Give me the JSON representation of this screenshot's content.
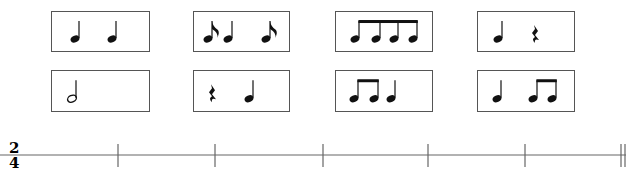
{
  "rhythm_cards": [
    {
      "id": "card-1",
      "row": 1,
      "col": 1,
      "x": 51,
      "y": 11,
      "w": 99,
      "h": 41,
      "content": "quarter quarter",
      "notes": [
        {
          "type": "quarter",
          "x": 23
        },
        {
          "type": "quarter",
          "x": 60
        }
      ]
    },
    {
      "id": "card-2",
      "row": 1,
      "col": 2,
      "x": 193,
      "y": 11,
      "w": 97,
      "h": 41,
      "content": "eighth quarter eighth",
      "notes": [
        {
          "type": "eighth",
          "x": 14
        },
        {
          "type": "quarter",
          "x": 34
        },
        {
          "type": "eighth",
          "x": 72
        }
      ]
    },
    {
      "id": "card-3",
      "row": 1,
      "col": 3,
      "x": 335,
      "y": 11,
      "w": 98,
      "h": 41,
      "content": "four beamed eighths",
      "notes": [
        {
          "type": "beam",
          "xs": [
            19,
            40,
            58,
            77
          ]
        }
      ]
    },
    {
      "id": "card-4",
      "row": 1,
      "col": 4,
      "x": 477,
      "y": 11,
      "w": 98,
      "h": 41,
      "content": "quarter quarter-rest",
      "notes": [
        {
          "type": "quarter",
          "x": 20
        },
        {
          "type": "quarter-rest",
          "x": 56
        }
      ]
    },
    {
      "id": "card-5",
      "row": 2,
      "col": 1,
      "x": 51,
      "y": 70,
      "w": 99,
      "h": 42,
      "content": "half note",
      "notes": [
        {
          "type": "half",
          "x": 20
        }
      ]
    },
    {
      "id": "card-6",
      "row": 2,
      "col": 2,
      "x": 193,
      "y": 70,
      "w": 97,
      "h": 42,
      "content": "quarter-rest quarter",
      "notes": [
        {
          "type": "quarter-rest",
          "x": 17
        },
        {
          "type": "quarter",
          "x": 55
        }
      ]
    },
    {
      "id": "card-7",
      "row": 2,
      "col": 3,
      "x": 335,
      "y": 70,
      "w": 98,
      "h": 42,
      "content": "two beamed eighths quarter",
      "notes": [
        {
          "type": "beam",
          "xs": [
            18,
            38
          ]
        },
        {
          "type": "quarter",
          "x": 55
        }
      ]
    },
    {
      "id": "card-8",
      "row": 2,
      "col": 4,
      "x": 477,
      "y": 70,
      "w": 98,
      "h": 42,
      "content": "quarter two beamed eighths",
      "notes": [
        {
          "type": "quarter",
          "x": 19
        },
        {
          "type": "beam",
          "xs": [
            55,
            74
          ]
        }
      ]
    }
  ],
  "staff": {
    "time_signature": {
      "top": "2",
      "bottom": "4"
    },
    "line_y": 25,
    "barlines_x": [
      118,
      215,
      323,
      428,
      525
    ],
    "final_double_barline_x": [
      621,
      625
    ]
  }
}
